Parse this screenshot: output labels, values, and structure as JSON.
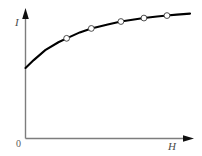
{
  "chart_data": {
    "type": "line",
    "title": "",
    "subtitle": "",
    "xlabel": "H",
    "ylabel": "I",
    "origin_label": "0",
    "grid": false,
    "legend": null,
    "annotations": [],
    "xlim": [
      0,
      1
    ],
    "ylim": [
      0,
      1
    ],
    "axis_ticks": {
      "x": [
        "0"
      ],
      "y": []
    },
    "series": [
      {
        "name": "magnetization-curve",
        "color": "#000000",
        "marker": "open-circle",
        "x": [
          0.0,
          0.05,
          0.12,
          0.2,
          0.25,
          0.33,
          0.4,
          0.5,
          0.58,
          0.66,
          0.72,
          0.8,
          0.86,
          0.92,
          1.0
        ],
        "y": [
          0.38,
          0.46,
          0.56,
          0.64,
          0.68,
          0.74,
          0.78,
          0.82,
          0.85,
          0.87,
          0.885,
          0.9,
          0.91,
          0.92,
          0.93
        ],
        "marked_points": [
          {
            "x": 0.25,
            "y": 0.68
          },
          {
            "x": 0.4,
            "y": 0.78
          },
          {
            "x": 0.58,
            "y": 0.85
          },
          {
            "x": 0.72,
            "y": 0.885
          },
          {
            "x": 0.86,
            "y": 0.91
          }
        ]
      }
    ]
  },
  "style": {
    "axis_color": "#7d7d7d",
    "curve_color": "#000000",
    "marker_fill": "#ffffff",
    "marker_stroke": "#3a3a3a",
    "background": "#ffffff"
  }
}
